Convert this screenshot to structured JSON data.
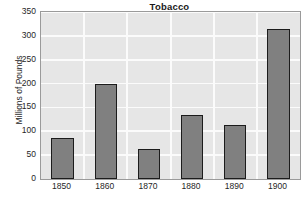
{
  "chart_data": {
    "type": "bar",
    "title": "Tobacco",
    "xlabel": "",
    "ylabel": "Millions of Pounds",
    "categories": [
      "1850",
      "1860",
      "1870",
      "1880",
      "1890",
      "1900"
    ],
    "values": [
      85,
      200,
      63,
      134,
      113,
      315
    ],
    "ylim": [
      0,
      350
    ],
    "yticks": [
      0,
      50,
      100,
      150,
      200,
      250,
      300,
      350
    ],
    "ytick_labels": [
      "0",
      "50",
      "100",
      "150",
      "200",
      "250",
      "300",
      "350"
    ],
    "grid": true,
    "grid_axis": "both",
    "legend": null,
    "bar_color": "#808080",
    "bar_edge_color": "#1c1c1c",
    "plot_background": "#e6e6e6",
    "grid_color": "#fbfbfb",
    "text_color": "#262626"
  }
}
